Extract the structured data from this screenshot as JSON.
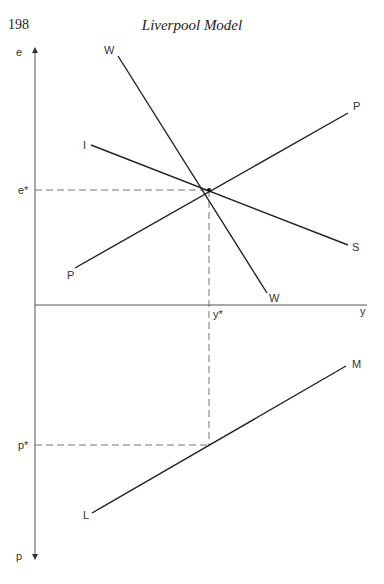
{
  "page": {
    "number": "198",
    "running_head": "Liverpool Model"
  },
  "diagram": {
    "axes": {
      "vertical_top_label": "e",
      "vertical_bottom_label": "p",
      "horizontal_label": "y"
    },
    "equilibrium": {
      "e_star_label": "e*",
      "y_star_label": "y*",
      "p_star_label": "p*"
    },
    "curves": [
      {
        "id": "WW",
        "start_label": "W",
        "end_label": "W"
      },
      {
        "id": "IS",
        "start_label": "I",
        "end_label": "S"
      },
      {
        "id": "PP",
        "start_label": "P",
        "end_label": "P"
      },
      {
        "id": "LM",
        "start_label": "L",
        "end_label": "M"
      }
    ],
    "colors": {
      "line": "#222222",
      "axis": "#555555",
      "dashed": "#666666"
    }
  }
}
